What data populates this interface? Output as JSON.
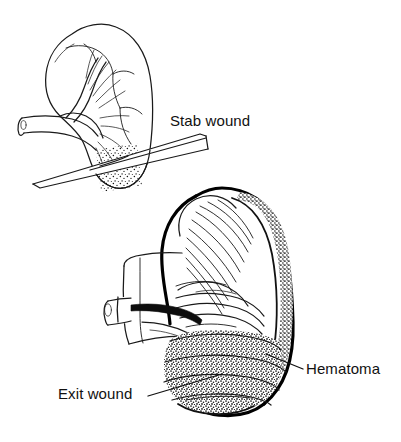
{
  "figure": {
    "type": "medical-line-illustration",
    "background_color": "#ffffff",
    "ink_color": "#111111",
    "panels": [
      {
        "id": "upper-panel",
        "name": "stab-wound-kidney",
        "description": "Intact kidney in outline with renal vessels at hilum and a knife blade penetrating the lower pole, with stippled hemorrhage at the entry site"
      },
      {
        "id": "lower-panel",
        "name": "exit-wound-kidney",
        "description": "Sectioned kidney with thick dark cortex, striated medullary pyramids, cut vessel stump at hilum and a stippled hematoma occupying the lower pole"
      }
    ]
  },
  "labels": [
    {
      "id": "stab-wound",
      "text": "Stab wound",
      "x": 170,
      "y": 126,
      "anchor": "start",
      "has_leader": false
    },
    {
      "id": "hematoma",
      "text": "Hematoma",
      "x": 306,
      "y": 374,
      "anchor": "start",
      "has_leader": true
    },
    {
      "id": "exit-wound",
      "text": "Exit wound",
      "x": 58,
      "y": 399,
      "anchor": "start",
      "has_leader": true
    }
  ],
  "colors": {
    "ink": "#111111",
    "solid_dark": "#0d0d0d",
    "paper": "#ffffff"
  }
}
